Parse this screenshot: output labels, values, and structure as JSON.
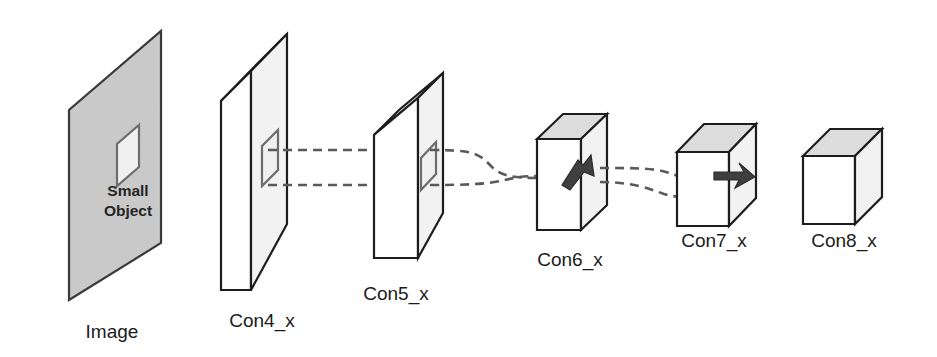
{
  "figure": {
    "type": "diagram",
    "background_color": "#ffffff",
    "width": 937,
    "height": 357
  },
  "palette": {
    "plane_fill": "#c9c9c9",
    "slab_front_fill": "#f2f2f2",
    "face_top_fill": "#dcdcdc",
    "face_side_fill": "#dcdcdc",
    "face_white_fill": "#ffffff",
    "outline": "#1d1d1d",
    "hole_outline": "#6d6d6d",
    "flow_line": "#5a5a5a",
    "marker_fill": "#3f3f3f",
    "label_text": "#1b1b1b"
  },
  "stages": [
    {
      "id": "image",
      "label": "Image",
      "label_x": 112,
      "label_y": 338,
      "shape": "plane",
      "has_object_region": true,
      "object_label_line1": "Small",
      "object_label_line2": "Object",
      "object_label_x": 128,
      "object_label_y1": 196,
      "object_label_y2": 216,
      "has_marker": false
    },
    {
      "id": "con4",
      "label": "Con4_x",
      "label_x": 262,
      "label_y": 327,
      "shape": "slab",
      "has_object_region": true,
      "has_marker": false
    },
    {
      "id": "con5",
      "label": "Con5_x",
      "label_x": 396,
      "label_y": 300,
      "shape": "slab",
      "has_object_region": true,
      "has_marker": false
    },
    {
      "id": "con6",
      "label": "Con6_x",
      "label_x": 570,
      "label_y": 266,
      "shape": "box",
      "has_object_region": false,
      "has_marker": true
    },
    {
      "id": "con7",
      "label": "Con7_x",
      "label_x": 714,
      "label_y": 247,
      "shape": "cube",
      "has_object_region": false,
      "has_marker": true
    },
    {
      "id": "con8",
      "label": "Con8_x",
      "label_x": 844,
      "label_y": 247,
      "shape": "cube",
      "has_object_region": false,
      "has_marker": false
    }
  ],
  "flow": {
    "description": "Two dashed projection lines tracing the small object region shrinking from Image through Con8_x",
    "line_count": 2,
    "style": "dashed"
  }
}
